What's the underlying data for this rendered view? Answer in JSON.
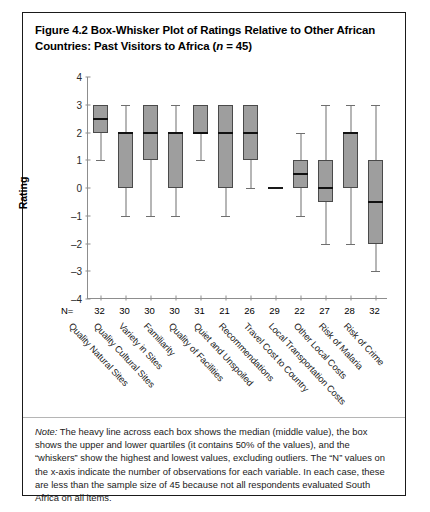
{
  "figure": {
    "title_line1": "Figure 4.2  Box-Whisker Plot of Ratings Relative to Other African",
    "title_line2_pre": "Countries: Past Visitors to Africa (",
    "title_line2_ital": "n",
    "title_line2_post": " = 45)",
    "note_prefix": "Note:",
    "note_body": " The heavy line across each box shows the median (middle value), the box shows the upper and lower quartiles (it contains 50% of the values), and the “whiskers” show the highest and lowest values, excluding outliers.  The “N” values on the x-axis indicate the number of observations for each variable. In each case, these are less than the sample size of 45 because not all respondents evaluated South Africa on all items.",
    "n_prefix": "N="
  },
  "chart_data": {
    "type": "box",
    "title": "Box-Whisker Plot of Ratings Relative to Other African Countries: Past Visitors to Africa (n = 45)",
    "xlabel": "",
    "ylabel": "Rating",
    "ylim": [
      -4,
      4
    ],
    "yticks": [
      4,
      3,
      2,
      1,
      0,
      -1,
      -2,
      -3,
      -4
    ],
    "grid": false,
    "legend": "none",
    "categories": [
      "Quality Natural Sites",
      "Quality Cultural Sites",
      "Variety in Sites",
      "Familiarity",
      "Quality of Facilities",
      "Quiet and Unspoiled",
      "Recommendations",
      "Travel Cost to Country",
      "Local Transportation Costs",
      "Other Local Costs",
      "Risk of Malaria",
      "Risk of Crime"
    ],
    "n_values": [
      32,
      30,
      30,
      30,
      31,
      21,
      26,
      29,
      22,
      27,
      28,
      32
    ],
    "boxes": [
      {
        "label": "Quality Natural Sites",
        "whisker_low": 1,
        "q1": 2,
        "median": 2.5,
        "q3": 3,
        "whisker_high": 3
      },
      {
        "label": "Quality Cultural Sites",
        "whisker_low": -1,
        "q1": 0,
        "median": 2,
        "q3": 2,
        "whisker_high": 3
      },
      {
        "label": "Variety in Sites",
        "whisker_low": -1,
        "q1": 1,
        "median": 2,
        "q3": 3,
        "whisker_high": 3
      },
      {
        "label": "Familiarity",
        "whisker_low": -1,
        "q1": 0,
        "median": 2,
        "q3": 2,
        "whisker_high": 3
      },
      {
        "label": "Quality of Facilities",
        "whisker_low": 1,
        "q1": 2,
        "median": 2,
        "q3": 3,
        "whisker_high": 3
      },
      {
        "label": "Quiet and Unspoiled",
        "whisker_low": -1,
        "q1": 0,
        "median": 2,
        "q3": 3,
        "whisker_high": 3
      },
      {
        "label": "Recommendations",
        "whisker_low": 0,
        "q1": 1,
        "median": 2,
        "q3": 3,
        "whisker_high": 3
      },
      {
        "label": "Travel Cost to Country",
        "whisker_low": 0,
        "q1": 0,
        "median": 0,
        "q3": 0,
        "whisker_high": 0
      },
      {
        "label": "Local Transportation Costs",
        "whisker_low": -1,
        "q1": 0,
        "median": 0.5,
        "q3": 1,
        "whisker_high": 2
      },
      {
        "label": "Other Local Costs",
        "whisker_low": -2,
        "q1": -0.5,
        "median": 0,
        "q3": 1,
        "whisker_high": 3
      },
      {
        "label": "Risk of Malaria",
        "whisker_low": -2,
        "q1": 0,
        "median": 2,
        "q3": 2,
        "whisker_high": 3
      },
      {
        "label": "Risk of Crime",
        "whisker_low": -3,
        "q1": -2,
        "median": -0.5,
        "q3": 1,
        "whisker_high": 3
      }
    ]
  },
  "colors": {
    "box_fill": "#9e9e9e",
    "box_border": "#4a4a4a",
    "median": "#111111",
    "whisker": "#6f6f6f",
    "axis": "#8d8d8d",
    "frame": "#1a1a1a"
  }
}
